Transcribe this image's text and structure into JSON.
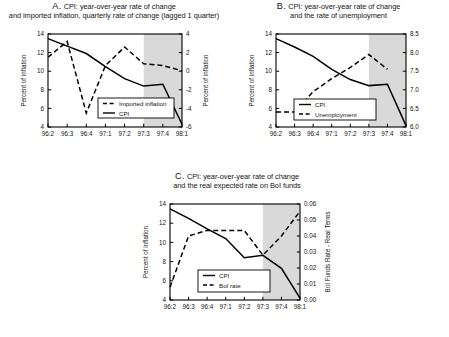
{
  "figure": {
    "background": "#ffffff",
    "forecast_shade_color": "#d9d9d9",
    "line_color": "#000000"
  },
  "panels": [
    {
      "id": "A",
      "label": "A.",
      "title_line1": "CPI: year-over-year rate of change",
      "title_line2": "and imported inflation, quarterly rate of change (lagged 1 quarter)",
      "ylabel_left": "Percent of inflation",
      "ylabel_right": "Percent of inflation",
      "legend": [
        {
          "name": "Imported inflation",
          "style": "dashed"
        },
        {
          "name": "CPI",
          "style": "solid"
        }
      ],
      "chart_data": {
        "type": "line",
        "title": "A. CPI: year-over-year rate of change and imported inflation, quarterly rate of change (lagged 1 quarter)",
        "xlabel": "",
        "ylabel": "Percent of inflation",
        "x": [
          "96:2",
          "96:3",
          "96:4",
          "97:1",
          "97:2",
          "97:3",
          "97:4",
          "98:1"
        ],
        "ylim": [
          4,
          14
        ],
        "yticks": [
          4,
          6,
          8,
          10,
          12,
          14
        ],
        "y2lim": [
          -6,
          4
        ],
        "y2ticks": [
          -6,
          -4,
          -2,
          0,
          2,
          4
        ],
        "y2label": "Percent of inflation",
        "grid": false,
        "legend_position": "lower-center",
        "forecast_start": "97:3",
        "forecast_end": "98:1",
        "series": [
          {
            "name": "CPI",
            "style": "solid",
            "axis": "left",
            "values": [
              13.5,
              12.7,
              11.9,
              10.5,
              9.2,
              8.4,
              8.6,
              4.3
            ]
          },
          {
            "name": "Imported inflation",
            "style": "dashed",
            "axis": "right",
            "values": [
              1.5,
              3.2,
              -4.5,
              0.6,
              2.6,
              0.8,
              0.6,
              0.05
            ]
          }
        ]
      }
    },
    {
      "id": "B",
      "label": "B.",
      "title_line1": "CPI: year-over-year rate of change",
      "title_line2": "and the rate of unemployment",
      "ylabel_left": "Percent of inflation",
      "ylabel_right": "",
      "legend": [
        {
          "name": "CPI",
          "style": "solid"
        },
        {
          "name": "Unemployment",
          "style": "dashed"
        }
      ],
      "chart_data": {
        "type": "line",
        "title": "B. CPI: year-over-year rate of change and the rate of unemployment",
        "xlabel": "",
        "ylabel": "Percent of inflation",
        "x": [
          "96:2",
          "96:3",
          "96:4",
          "97:1",
          "97:2",
          "97:3",
          "97:4",
          "98:1"
        ],
        "ylim": [
          4,
          14
        ],
        "yticks": [
          4,
          6,
          8,
          10,
          12,
          14
        ],
        "y2lim": [
          6.0,
          8.5
        ],
        "y2ticks": [
          "6.0",
          "6.5",
          "7.0",
          "7.5",
          "8.0",
          "8.5"
        ],
        "y2label": "",
        "grid": false,
        "legend_position": "lower-center",
        "forecast_start": "97:3",
        "forecast_end": "98:1",
        "series": [
          {
            "name": "CPI",
            "style": "solid",
            "axis": "left",
            "values": [
              13.5,
              12.6,
              11.6,
              10.2,
              9.1,
              8.45,
              8.6,
              4.15
            ]
          },
          {
            "name": "Unemployment",
            "style": "dashed",
            "axis": "right",
            "values": [
              6.4,
              6.4,
              6.95,
              7.3,
              7.6,
              7.95,
              7.55,
              null
            ]
          }
        ]
      }
    },
    {
      "id": "C",
      "label": "C.",
      "title_line1": "CPI: year-over-year rate of change",
      "title_line2": "and the real expected rate on BoI funds",
      "ylabel_left": "Percent of inflation",
      "ylabel_right": "BoI Funds Rate - Real Terms",
      "legend": [
        {
          "name": "CPI",
          "style": "solid"
        },
        {
          "name": "BoI rate",
          "style": "dashed"
        }
      ],
      "chart_data": {
        "type": "line",
        "title": "C. CPI: year-over-year rate of change and the real expected rate on BoI funds",
        "xlabel": "",
        "ylabel": "Percent of inflation",
        "x": [
          "96:2",
          "96:3",
          "96:4",
          "97:1",
          "97:2",
          "97:3",
          "97:4",
          "98:1"
        ],
        "ylim": [
          4,
          14
        ],
        "yticks": [
          4,
          6,
          8,
          10,
          12,
          14
        ],
        "y2lim": [
          0.0,
          0.06
        ],
        "y2ticks": [
          "0.00",
          "0.01",
          "0.02",
          "0.03",
          "0.04",
          "0.05",
          "0.06"
        ],
        "y2label": "BoI Funds Rate - Real Terms",
        "grid": false,
        "legend_position": "lower-center",
        "forecast_start": "97:3",
        "forecast_end": "98:1",
        "series": [
          {
            "name": "CPI",
            "style": "solid",
            "axis": "left",
            "values": [
              13.5,
              12.5,
              11.4,
              10.4,
              8.4,
              8.65,
              7.3,
              4.2
            ]
          },
          {
            "name": "BoI rate",
            "style": "dashed",
            "axis": "right",
            "values": [
              0.008,
              0.04,
              0.0435,
              0.0435,
              0.0435,
              0.028,
              0.04,
              0.0555
            ]
          }
        ]
      }
    }
  ]
}
